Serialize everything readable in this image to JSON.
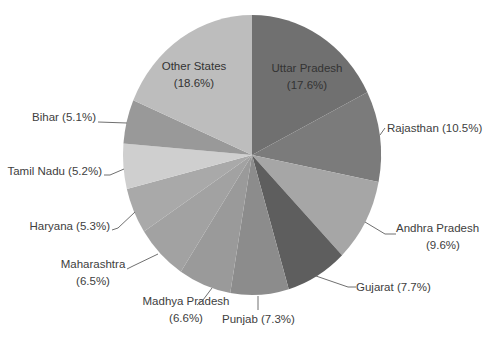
{
  "chart_data": {
    "type": "pie",
    "title": "",
    "start_angle_deg": 0,
    "direction": "clockwise",
    "categories": [
      "Uttar Pradesh",
      "Rajasthan",
      "Andhra Pradesh",
      "Gujarat",
      "Punjab",
      "Madhya Pradesh",
      "Maharashtra",
      "Haryana",
      "Tamil Nadu",
      "Bihar",
      "Other States"
    ],
    "values": [
      17.6,
      10.5,
      9.6,
      7.7,
      7.3,
      6.6,
      6.5,
      5.3,
      5.2,
      5.1,
      18.6
    ],
    "unit": "%",
    "legend": "none",
    "data_labels": [
      {
        "lines": [
          "Uttar Pradesh",
          "(17.6%)"
        ],
        "inside": true,
        "x": 307,
        "y": 72
      },
      {
        "lines": [
          "Rajasthan  (10.5%)"
        ],
        "inside": false,
        "x": 387,
        "y": 132,
        "anchor": "start",
        "leader": [
          [
            385,
            128
          ],
          [
            380,
            135
          ]
        ]
      },
      {
        "lines": [
          "Andhra Pradesh",
          "(9.6%)"
        ],
        "inside": false,
        "x": 396,
        "y": 232,
        "anchor": "start",
        "leader": [
          [
            396,
            234
          ],
          [
            385,
            234
          ],
          [
            365,
            222
          ]
        ]
      },
      {
        "lines": [
          "Gujarat (7.7%)"
        ],
        "inside": false,
        "x": 356,
        "y": 291,
        "anchor": "start",
        "leader": [
          [
            356,
            287
          ],
          [
            348,
            287
          ],
          [
            316,
            276
          ]
        ]
      },
      {
        "lines": [
          "Punjab (7.3%)"
        ],
        "inside": false,
        "x": 222,
        "y": 323,
        "anchor": "start",
        "leader": [
          [
            258,
            296
          ],
          [
            258,
            310
          ]
        ]
      },
      {
        "lines": [
          "Madhya Pradesh",
          "(6.6%)"
        ],
        "inside": false,
        "x": 186,
        "y": 305,
        "anchor": "middle",
        "leader": [
          [
            197,
            305
          ],
          [
            203,
            300
          ],
          [
            212,
            288
          ]
        ]
      },
      {
        "lines": [
          "Maharashtra",
          "(6.5%)"
        ],
        "inside": false,
        "x": 93,
        "y": 268,
        "anchor": "middle",
        "leader": [
          [
            127,
            269
          ],
          [
            133,
            266
          ],
          [
            158,
            254
          ]
        ]
      },
      {
        "lines": [
          "Haryana (5.3%)"
        ],
        "inside": false,
        "x": 110,
        "y": 230,
        "anchor": "end",
        "leader": [
          [
            112,
            230
          ],
          [
            118,
            228
          ],
          [
            135,
            212
          ]
        ]
      },
      {
        "lines": [
          "Tamil Nadu (5.2%)"
        ],
        "inside": false,
        "x": 102,
        "y": 175,
        "anchor": "end",
        "leader": [
          [
            104,
            175
          ],
          [
            110,
            175
          ],
          [
            124,
            169
          ]
        ]
      },
      {
        "lines": [
          "Bihar (5.1%)"
        ],
        "inside": false,
        "x": 96,
        "y": 121,
        "anchor": "end",
        "leader": [
          [
            98,
            122
          ],
          [
            127,
            123
          ]
        ]
      },
      {
        "lines": [
          "Other States",
          "(18.6%)"
        ],
        "inside": true,
        "x": 194,
        "y": 70
      }
    ],
    "colors": [
      "#707070",
      "#7b7b7b",
      "#a6a6a6",
      "#5e5e5e",
      "#8c8c8c",
      "#9a9a9a",
      "#a2a2a2",
      "#a9a9a9",
      "#cfcfcf",
      "#999999",
      "#bdbdbd"
    ],
    "center": [
      252,
      155
    ],
    "radius_x": 129,
    "radius_y": 140
  }
}
